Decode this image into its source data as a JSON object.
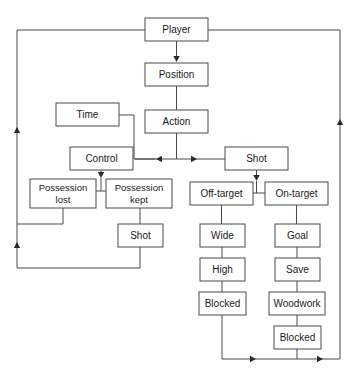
{
  "diagram": {
    "type": "flowchart",
    "background_color": "#ffffff",
    "box_stroke_color": "#4a4a4a",
    "box_fill_color": "#ffffff",
    "text_color": "#1a1a1a",
    "nodes": [
      {
        "id": "player",
        "label": "Player",
        "label_line1": "Player",
        "label_line2": "",
        "x": 145,
        "y": 18,
        "w": 63,
        "h": 23
      },
      {
        "id": "position",
        "label": "Position",
        "label_line1": "Position",
        "label_line2": "",
        "x": 145,
        "y": 63,
        "w": 63,
        "h": 23
      },
      {
        "id": "time",
        "label": "Time",
        "label_line1": "Time",
        "label_line2": "",
        "x": 56,
        "y": 103,
        "w": 63,
        "h": 23
      },
      {
        "id": "action",
        "label": "Action",
        "label_line1": "Action",
        "label_line2": "",
        "x": 145,
        "y": 110,
        "w": 63,
        "h": 23
      },
      {
        "id": "control",
        "label": "Control",
        "label_line1": "Control",
        "label_line2": "",
        "x": 70,
        "y": 147,
        "w": 63,
        "h": 23
      },
      {
        "id": "shot_top",
        "label": "Shot",
        "label_line1": "Shot",
        "label_line2": "",
        "x": 225,
        "y": 147,
        "w": 63,
        "h": 23
      },
      {
        "id": "possession_lost",
        "label": "Possession lost",
        "label_line1": "Possession",
        "label_line2": "lost",
        "x": 30,
        "y": 179,
        "w": 66,
        "h": 29
      },
      {
        "id": "possession_kept",
        "label": "Possession kept",
        "label_line1": "Possession",
        "label_line2": "kept",
        "x": 106,
        "y": 179,
        "w": 66,
        "h": 29
      },
      {
        "id": "off_target",
        "label": "Off-target",
        "label_line1": "Off-target",
        "label_line2": "",
        "x": 190,
        "y": 182,
        "w": 63,
        "h": 23
      },
      {
        "id": "on_target",
        "label": "On-target",
        "label_line1": "On-target",
        "label_line2": "",
        "x": 265,
        "y": 182,
        "w": 63,
        "h": 23
      },
      {
        "id": "shot_bottom",
        "label": "Shot",
        "label_line1": "Shot",
        "label_line2": "",
        "x": 118,
        "y": 224,
        "w": 45,
        "h": 23
      },
      {
        "id": "wide",
        "label": "Wide",
        "label_line1": "Wide",
        "label_line2": "",
        "x": 200,
        "y": 224,
        "w": 45,
        "h": 23
      },
      {
        "id": "goal",
        "label": "Goal",
        "label_line1": "Goal",
        "label_line2": "",
        "x": 275,
        "y": 224,
        "w": 45,
        "h": 23
      },
      {
        "id": "high",
        "label": "High",
        "label_line1": "High",
        "label_line2": "",
        "x": 200,
        "y": 258,
        "w": 45,
        "h": 23
      },
      {
        "id": "save",
        "label": "Save",
        "label_line1": "Save",
        "label_line2": "",
        "x": 275,
        "y": 258,
        "w": 45,
        "h": 23
      },
      {
        "id": "blocked_left",
        "label": "Blocked",
        "label_line1": "Blocked",
        "label_line2": "",
        "x": 199,
        "y": 292,
        "w": 47,
        "h": 23
      },
      {
        "id": "woodwork",
        "label": "Woodwork",
        "label_line1": "Woodwork",
        "label_line2": "",
        "x": 269,
        "y": 292,
        "w": 56,
        "h": 23
      },
      {
        "id": "blocked_right",
        "label": "Blocked",
        "label_line1": "Blocked",
        "label_line2": "",
        "x": 274,
        "y": 326,
        "w": 47,
        "h": 23
      }
    ],
    "edges": [
      {
        "id": "player-to-position",
        "from": "player",
        "to": "position",
        "path": "M176.5,41 L176.5,60",
        "arrow": {
          "x": 176.5,
          "y": 62,
          "dir": "down"
        }
      },
      {
        "id": "position-to-action",
        "from": "position",
        "to": "action",
        "path": "M176.5,86 L176.5,110",
        "arrow": null
      },
      {
        "id": "time-to-junction",
        "from": "time",
        "to": "control",
        "path": "M119,115 L134,115 L134,159 L155,159",
        "arrow": null
      },
      {
        "id": "action-to-split",
        "from": "action",
        "to": "junction",
        "path": "M176.5,133 L176.5,159",
        "arrow": null
      },
      {
        "id": "split-to-control",
        "from": "junction",
        "to": "control",
        "path": "M176.5,159 L135,159",
        "arrow": {
          "x": 156,
          "y": 159,
          "dir": "left"
        }
      },
      {
        "id": "split-to-shot",
        "from": "junction",
        "to": "shot_top",
        "path": "M176.5,159 L225,159",
        "arrow": {
          "x": 197,
          "y": 159,
          "dir": "right"
        }
      },
      {
        "id": "control-to-possession",
        "from": "control",
        "to": "possession",
        "path": "M101,170 L101,176",
        "arrow": {
          "x": 101,
          "y": 178,
          "dir": "down"
        }
      },
      {
        "id": "possession-split-bar",
        "from": "possession",
        "to": "both",
        "path": "M101,178 L101,191 M63,191 L139,191 M63,191 L63,179 M139,191 L139,179",
        "arrow": null
      },
      {
        "id": "shot-to-targets",
        "from": "shot_top",
        "to": "targets",
        "path": "M256.5,170 L256.5,179",
        "arrow": {
          "x": 256.5,
          "y": 181,
          "dir": "down"
        }
      },
      {
        "id": "targets-split-bar",
        "from": "targets",
        "to": "both",
        "path": "M256.5,181 L256.5,193 M221.5,193 L296.5,193 M221.5,193 L221.5,182 M296.5,193 L296.5,182",
        "arrow": null
      },
      {
        "id": "possession-kept-to-shot",
        "from": "possession_kept",
        "to": "shot_bottom",
        "path": "M140,208 L140,224",
        "arrow": null
      },
      {
        "id": "off-target-to-wide",
        "from": "off_target",
        "to": "wide",
        "path": "M221.5,205 L221.5,224",
        "arrow": null
      },
      {
        "id": "wide-to-high",
        "from": "wide",
        "to": "high",
        "path": "M222,247 L222,258",
        "arrow": null
      },
      {
        "id": "high-to-blocked",
        "from": "high",
        "to": "blocked_left",
        "path": "M222,281 L222,292",
        "arrow": null
      },
      {
        "id": "on-target-to-goal",
        "from": "on_target",
        "to": "goal",
        "path": "M296.5,205 L296.5,224",
        "arrow": null
      },
      {
        "id": "goal-to-save",
        "from": "goal",
        "to": "save",
        "path": "M297,247 L297,258",
        "arrow": null
      },
      {
        "id": "save-to-woodwork",
        "from": "save",
        "to": "woodwork",
        "path": "M297,281 L297,292",
        "arrow": null
      },
      {
        "id": "woodwork-to-blocked",
        "from": "woodwork",
        "to": "blocked_right",
        "path": "M297,315 L297,326",
        "arrow": null
      },
      {
        "id": "blocked-left-to-bottom",
        "from": "blocked_left",
        "to": "bottom_rail",
        "path": "M222,315 L222,359",
        "arrow": null
      },
      {
        "id": "blocked-right-to-bottom",
        "from": "blocked_right",
        "to": "bottom_rail",
        "path": "M297,349 L297,359",
        "arrow": null
      },
      {
        "id": "bottom-rail",
        "from": "bottom_rail",
        "to": "right_rail",
        "path": "M222,359 L340,359",
        "arrow": null
      },
      {
        "id": "bottom-arrow-left",
        "from": "bottom_rail",
        "to": "right_rail",
        "path": "",
        "arrow": {
          "x": 256,
          "y": 359,
          "dir": "right"
        }
      },
      {
        "id": "bottom-arrow-right",
        "from": "bottom_rail",
        "to": "right_rail",
        "path": "",
        "arrow": {
          "x": 323,
          "y": 359,
          "dir": "right"
        }
      },
      {
        "id": "right-rail-up",
        "from": "right_rail",
        "to": "player",
        "path": "M340,359 L340,30 L208,30",
        "arrow": {
          "x": 340,
          "y": 119,
          "dir": "up"
        }
      },
      {
        "id": "left-rail-top",
        "from": "player",
        "to": "left_rail",
        "path": "M145,30 L17,30 L17,268",
        "arrow": null
      },
      {
        "id": "left-rail-arrow-upper",
        "from": "left_rail",
        "to": "player",
        "path": "",
        "arrow": {
          "x": 17,
          "y": 127,
          "dir": "up"
        }
      },
      {
        "id": "left-rail-arrow-lower",
        "from": "left_rail",
        "to": "player",
        "path": "",
        "arrow": {
          "x": 17,
          "y": 242,
          "dir": "up"
        }
      },
      {
        "id": "possession-lost-to-left",
        "from": "possession_lost",
        "to": "left_rail",
        "path": "M63,208 L63,224 L17,224",
        "arrow": null
      },
      {
        "id": "shot-bottom-to-left",
        "from": "shot_bottom",
        "to": "left_rail",
        "path": "M140,247 L140,268 L17,268",
        "arrow": null
      }
    ]
  }
}
